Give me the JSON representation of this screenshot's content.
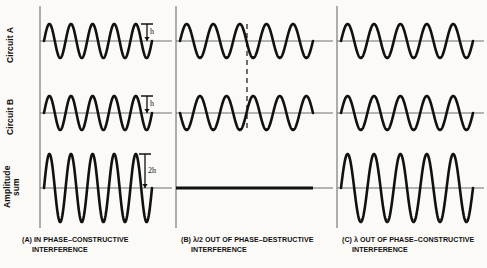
{
  "figure": {
    "background_color": "#fbfaf7",
    "ink_color": "#111111",
    "baseline_color": "#6e6e6e",
    "row_labels": [
      {
        "id": "circuit-a",
        "text": "Circuit A"
      },
      {
        "id": "circuit-b",
        "text": "Circuit B"
      },
      {
        "id": "amplitude-sum",
        "line1": "Amplitude",
        "line2": "sum"
      }
    ],
    "amplitude_annotations": [
      {
        "id": "h-circuit-a",
        "text": "h"
      },
      {
        "id": "h-circuit-b",
        "text": "h"
      },
      {
        "id": "two-h-sum",
        "text": "2h"
      }
    ],
    "panels": [
      {
        "id": "panel-a",
        "caption_line1": "(A) IN PHASE–CONSTRUCTIVE",
        "caption_line2": "INTERFERENCE"
      },
      {
        "id": "panel-b",
        "caption_line1": "(B) λ/2 OUT OF PHASE–DESTRUCTIVE",
        "caption_line2": "INTERFERENCE"
      },
      {
        "id": "panel-c",
        "caption_line1": "(C) λ OUT OF PHASE–CONSTRUCTIVE",
        "caption_line2": "INTERFERENCE"
      }
    ]
  },
  "chart_data": {
    "type": "line",
    "xlabel": "",
    "ylabel": "Amplitude",
    "grid": false,
    "legend_position": "none",
    "x_range": [
      0,
      5
    ],
    "cycles_per_panel": 5,
    "panels": [
      {
        "name": "(A) IN PHASE–CONSTRUCTIVE INTERFERENCE",
        "phase_difference_label": "in phase",
        "phase_difference_radians": 0,
        "series": [
          {
            "name": "Circuit A",
            "amplitude": 1,
            "amplitude_label": "h",
            "phase": 0,
            "cycles": 5
          },
          {
            "name": "Circuit B",
            "amplitude": 1,
            "amplitude_label": "h",
            "phase": 0,
            "cycles": 5
          },
          {
            "name": "Amplitude sum",
            "amplitude": 2,
            "amplitude_label": "2h",
            "phase": 0,
            "cycles": 5
          }
        ]
      },
      {
        "name": "(B) λ/2 OUT OF PHASE–DESTRUCTIVE INTERFERENCE",
        "phase_difference_label": "λ/2",
        "phase_difference_radians": 3.14159,
        "series": [
          {
            "name": "Circuit A",
            "amplitude": 1,
            "amplitude_label": "h",
            "phase": 0,
            "cycles": 5
          },
          {
            "name": "Circuit B",
            "amplitude": 1,
            "amplitude_label": "h",
            "phase": 3.14159,
            "cycles": 5
          },
          {
            "name": "Amplitude sum",
            "amplitude": 0,
            "amplitude_label": "0",
            "phase": 0,
            "cycles": 5
          }
        ]
      },
      {
        "name": "(C) λ OUT OF PHASE–CONSTRUCTIVE INTERFERENCE",
        "phase_difference_label": "λ",
        "phase_difference_radians": 6.28318,
        "series": [
          {
            "name": "Circuit A",
            "amplitude": 1,
            "amplitude_label": "h",
            "phase": 0,
            "cycles": 5
          },
          {
            "name": "Circuit B",
            "amplitude": 1,
            "amplitude_label": "h",
            "phase": 6.28318,
            "cycles": 5
          },
          {
            "name": "Amplitude sum",
            "amplitude": 2,
            "amplitude_label": "2h",
            "phase": 0,
            "cycles": 5
          }
        ]
      }
    ]
  }
}
